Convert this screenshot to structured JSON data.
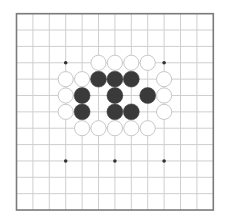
{
  "board": {
    "size": 13,
    "origin_x": 16.5,
    "origin_y": 13.7,
    "spacing_x": 16.4,
    "spacing_y": 16.36,
    "colors": {
      "background": "#ffffff",
      "grid_line": "#cfcfcf",
      "border": "#7a7a7a",
      "star_point": "#333333",
      "black_stone": "#3a3a3a",
      "white_stone_fill": "#ffffff",
      "white_stone_outline": "#c8c8c8"
    },
    "star_points": [
      {
        "col": 3,
        "row": 3
      },
      {
        "col": 9,
        "row": 3
      },
      {
        "col": 3,
        "row": 9
      },
      {
        "col": 6,
        "row": 9
      },
      {
        "col": 9,
        "row": 9
      }
    ],
    "stones": [
      {
        "color": "white",
        "col": 5,
        "row": 3
      },
      {
        "color": "white",
        "col": 6,
        "row": 3
      },
      {
        "color": "white",
        "col": 7,
        "row": 3
      },
      {
        "color": "white",
        "col": 8,
        "row": 3
      },
      {
        "color": "white",
        "col": 3,
        "row": 4
      },
      {
        "color": "white",
        "col": 4,
        "row": 4
      },
      {
        "color": "black",
        "col": 5,
        "row": 4
      },
      {
        "color": "black",
        "col": 6,
        "row": 4
      },
      {
        "color": "black",
        "col": 7,
        "row": 4
      },
      {
        "color": "white",
        "col": 9,
        "row": 4
      },
      {
        "color": "white",
        "col": 3,
        "row": 5
      },
      {
        "color": "black",
        "col": 4,
        "row": 5
      },
      {
        "color": "black",
        "col": 6,
        "row": 5
      },
      {
        "color": "black",
        "col": 8,
        "row": 5
      },
      {
        "color": "white",
        "col": 9,
        "row": 5
      },
      {
        "color": "white",
        "col": 3,
        "row": 6
      },
      {
        "color": "black",
        "col": 4,
        "row": 6
      },
      {
        "color": "black",
        "col": 6,
        "row": 6
      },
      {
        "color": "black",
        "col": 7,
        "row": 6
      },
      {
        "color": "white",
        "col": 9,
        "row": 6
      },
      {
        "color": "white",
        "col": 4,
        "row": 7
      },
      {
        "color": "white",
        "col": 5,
        "row": 7
      },
      {
        "color": "white",
        "col": 6,
        "row": 7
      },
      {
        "color": "white",
        "col": 7,
        "row": 7
      },
      {
        "color": "white",
        "col": 8,
        "row": 7
      }
    ]
  }
}
